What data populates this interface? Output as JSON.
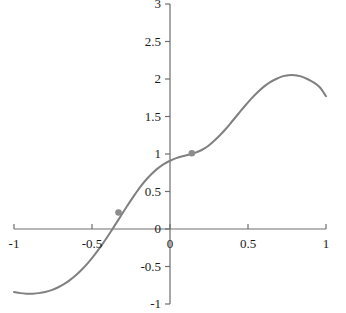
{
  "chart_data": {
    "type": "line",
    "title": "",
    "subtitle": "",
    "xlabel": "",
    "ylabel": "",
    "xlim": [
      -1,
      1
    ],
    "ylim": [
      -1,
      3
    ],
    "grid": false,
    "legend": "none",
    "axes": {
      "x_ticks": [
        -1,
        -0.5,
        0,
        0.5,
        1
      ],
      "x_tick_labels": [
        "-1",
        "-0.5",
        "0",
        "0.5",
        "1"
      ],
      "y_ticks": [
        -1,
        -0.5,
        0,
        0.5,
        1,
        1.5,
        2,
        2.5,
        3
      ],
      "y_tick_labels": [
        "-1",
        "-0.5",
        "0",
        "0.5",
        "1",
        "1.5",
        "2",
        "2.5",
        "3"
      ],
      "x_axis_position_y": 0,
      "y_axis_position_x": 0
    },
    "series": [
      {
        "name": "curve",
        "color": "#808080",
        "style": "solid",
        "width": 2,
        "x": [
          -1.0,
          -0.96,
          -0.92,
          -0.88,
          -0.84,
          -0.8,
          -0.76,
          -0.72,
          -0.68,
          -0.64,
          -0.6,
          -0.56,
          -0.52,
          -0.48,
          -0.44,
          -0.4,
          -0.36,
          -0.32,
          -0.28,
          -0.24,
          -0.2,
          -0.16,
          -0.12,
          -0.08,
          -0.04,
          0.0,
          0.04,
          0.08,
          0.12,
          0.16,
          0.2,
          0.24,
          0.28,
          0.32,
          0.36,
          0.4,
          0.44,
          0.48,
          0.52,
          0.56,
          0.6,
          0.64,
          0.68,
          0.72,
          0.76,
          0.8,
          0.84,
          0.88,
          0.92,
          0.96,
          1.0
        ],
        "y": [
          -0.84,
          -0.855,
          -0.862,
          -0.862,
          -0.855,
          -0.84,
          -0.815,
          -0.78,
          -0.735,
          -0.678,
          -0.61,
          -0.53,
          -0.438,
          -0.335,
          -0.222,
          -0.1,
          0.028,
          0.158,
          0.29,
          0.415,
          0.535,
          0.64,
          0.73,
          0.805,
          0.865,
          0.91,
          0.945,
          0.97,
          0.99,
          1.015,
          1.05,
          1.1,
          1.17,
          1.25,
          1.34,
          1.44,
          1.54,
          1.64,
          1.735,
          1.82,
          1.895,
          1.955,
          2.0,
          2.035,
          2.05,
          2.05,
          2.035,
          2.0,
          1.955,
          1.89,
          1.77
        ]
      }
    ],
    "markers": [
      {
        "label": "point-1",
        "x": -0.33,
        "y": 0.22,
        "color": "#8c8c8c"
      },
      {
        "label": "point-2",
        "x": 0.14,
        "y": 1.01,
        "color": "#8c8c8c"
      }
    ],
    "annotations": []
  },
  "style": {
    "axis_color": "#6e6e6e",
    "curve_color": "#808080",
    "marker_color": "#8c8c8c",
    "text_color": "#1a1a1a",
    "background": "#ffffff"
  }
}
